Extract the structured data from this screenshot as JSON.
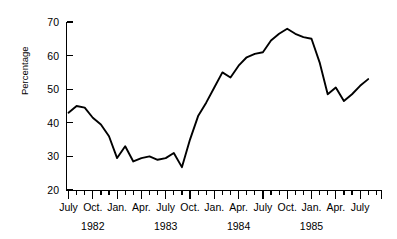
{
  "chart_data": {
    "type": "line",
    "title": "",
    "xlabel": "",
    "ylabel": "Percentage",
    "ylim": [
      20,
      70
    ],
    "yticks": [
      20,
      30,
      40,
      50,
      60,
      70
    ],
    "ytick_labels": [
      "20",
      "30",
      "40",
      "50",
      "60",
      "70"
    ],
    "grid": false,
    "legend": "none",
    "xlim": [
      "1982-07",
      "1985-09"
    ],
    "x_quarter_labels": [
      "July",
      "Oct.",
      "Jan.",
      "Apr.",
      "July",
      "Oct.",
      "Jan.",
      "Apr.",
      "July",
      "Oct.",
      "Jan.",
      "Apr.",
      "July"
    ],
    "x_year_labels": [
      "1982",
      "1983",
      "1984",
      "1985"
    ],
    "x_year_label_positions": [
      1,
      4,
      7,
      10
    ],
    "x_minor_tick_interval_months": 1,
    "series": [
      {
        "name": "Percentage",
        "x": [
          "1982-07",
          "1982-08",
          "1982-09",
          "1982-10",
          "1982-11",
          "1982-12",
          "1983-01",
          "1983-02",
          "1983-03",
          "1983-04",
          "1983-05",
          "1983-06",
          "1983-07",
          "1983-08",
          "1983-09",
          "1983-10",
          "1983-11",
          "1983-12",
          "1984-01",
          "1984-02",
          "1984-03",
          "1984-04",
          "1984-05",
          "1984-06",
          "1984-07",
          "1984-08",
          "1984-09",
          "1984-10",
          "1984-11",
          "1984-12",
          "1985-01",
          "1985-02",
          "1985-03",
          "1985-04",
          "1985-05",
          "1985-06",
          "1985-07",
          "1985-08"
        ],
        "values": [
          43.0,
          45.0,
          44.5,
          41.5,
          39.5,
          36.0,
          29.5,
          33.0,
          28.5,
          29.5,
          30.0,
          29.0,
          29.5,
          31.0,
          26.8,
          35.0,
          42.0,
          46.0,
          50.5,
          55.0,
          53.5,
          57.0,
          59.5,
          60.5,
          61.0,
          64.5,
          66.5,
          68.0,
          66.5,
          65.5,
          65.0,
          58.0,
          48.5,
          50.5,
          46.5,
          48.5,
          51.0,
          53.0
        ]
      }
    ]
  }
}
